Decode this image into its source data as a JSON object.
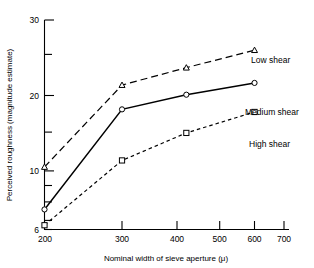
{
  "chart_data": {
    "type": "line",
    "title": "",
    "xlabel": "Nominal width of sieve aperture (μ)",
    "ylabel": "Perceived roughness (magnitude estimate)",
    "xscale": "log",
    "yscale": "log",
    "xlim": [
      200,
      700
    ],
    "ylim": [
      6,
      30
    ],
    "grid": false,
    "legend_position": "inline-right",
    "xticks": [
      200,
      300,
      400,
      500,
      600,
      700
    ],
    "xtick_labels": [
      "200",
      "300",
      "400",
      "500",
      "600",
      "700"
    ],
    "yticks": [
      6,
      7,
      8,
      9,
      10,
      15,
      20,
      25,
      30
    ],
    "ytick_labels": [
      "6",
      "",
      "",
      "",
      "10",
      "",
      "20",
      "",
      "30"
    ],
    "x": [
      200,
      300,
      420,
      600
    ],
    "series": [
      {
        "name": "Low shear",
        "marker": "triangle",
        "linestyle": "long-dash",
        "values": [
          9.7,
          18.2,
          20.8,
          23.8
        ]
      },
      {
        "name": "Medium shear",
        "marker": "circle",
        "linestyle": "solid",
        "values": [
          7.0,
          15.1,
          16.9,
          18.5
        ]
      },
      {
        "name": "High shear",
        "marker": "square",
        "linestyle": "short-dash",
        "values": [
          6.2,
          10.2,
          12.6,
          14.8
        ]
      }
    ],
    "colors": {
      "line": "#000000",
      "axis": "#000000",
      "background": "#ffffff"
    }
  },
  "labels": {
    "xaxis": "Nominal width of sieve aperture (μ)",
    "yaxis": "Perceived roughness (magnitude estimate)",
    "low": "Low shear",
    "medium": "Medium shear",
    "high": "High shear",
    "y_30": "30",
    "y_20": "20",
    "y_10": "10",
    "y_6": "6",
    "x_200": "200",
    "x_300": "300",
    "x_400": "400",
    "x_500": "500",
    "x_600": "600",
    "x_700": "700"
  }
}
